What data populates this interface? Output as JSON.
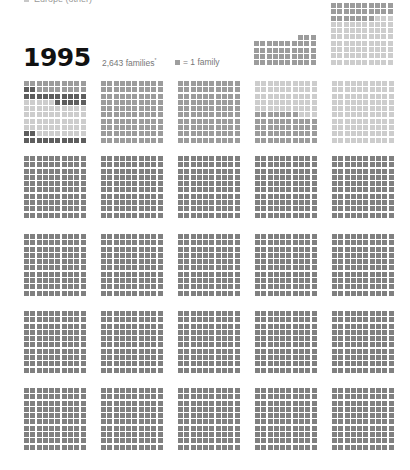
{
  "legend": {
    "label": "Europe (other)",
    "swatch_color": "#c8c8c8"
  },
  "header": {
    "year": "1995",
    "families_label": "2,643 families",
    "families_footnote": "*",
    "unit_label": "= 1 family",
    "unit_swatch_color": "#9e9e9e"
  },
  "colors": {
    "D": "#5e5e5e",
    "M": "#9c9c9c",
    "L": "#cdcdcd",
    "G": "#808080",
    "_": "transparent"
  },
  "chart_data": {
    "type": "waffle",
    "title": "1995",
    "subtitle": "2,643 families*",
    "unit": "1 square = 1 family",
    "legend": [
      "Europe (other)"
    ],
    "grid_size": [
      10,
      10
    ],
    "grids": [
      {
        "id": "top-partial",
        "x": 254,
        "y": 35,
        "rows": [
          "_______MMM",
          "MMMMMMMMMM",
          "MMMMMMMMMM",
          "MMMMMMMMMM",
          "MMMMMMMMMM"
        ],
        "count": 43
      },
      {
        "id": "top-full",
        "x": 331,
        "y": 3,
        "rows": [
          "MMMMMMMMMM",
          "MMMMMMMMMM",
          "MMMMMMMLLL",
          "LLLLLLLLLL",
          "LLLLLLLLLL",
          "LLLLLLLLLL",
          "LLLLLLLLLL",
          "LLLLLLLLLL",
          "LLLLLLLLLL",
          "LLLLLLLLLL"
        ],
        "count": 100
      },
      {
        "id": "r1c1",
        "x": 24,
        "y": 81,
        "rows": [
          "MMMMMMMMMM",
          "DDMMMMMMMM",
          "DDDDDDDDDD",
          "LLLLLDDDDD",
          "LLLLLLLLLL",
          "LLLLLLLLLL",
          "LLLLLLLLLL",
          "LLLLLLLLLL",
          "DDLLLLLLLL",
          "DDDDDDDDDD"
        ],
        "count": 100
      },
      {
        "id": "r1c2",
        "x": 101,
        "y": 81,
        "fill": "M",
        "count": 100
      },
      {
        "id": "r1c3",
        "x": 178,
        "y": 81,
        "fill": "M",
        "count": 100
      },
      {
        "id": "r1c4",
        "x": 255,
        "y": 81,
        "rows": [
          "LLLLLLLLLL",
          "LLLLLLLLLL",
          "LLLLLLLLLL",
          "LLLLLLLLLL",
          "LLLLLLLLLL",
          "MMMMMMMLLL",
          "MMMMMMMMMM",
          "MMMMMMMMMM",
          "MMMMMMMMMM",
          "MMMMMMMMMM"
        ],
        "count": 100
      },
      {
        "id": "r1c5",
        "x": 332,
        "y": 81,
        "fill": "L",
        "count": 100
      },
      {
        "id": "r2c1",
        "x": 24,
        "y": 156,
        "fill": "G",
        "count": 100
      },
      {
        "id": "r2c2",
        "x": 101,
        "y": 156,
        "fill": "G",
        "count": 100
      },
      {
        "id": "r2c3",
        "x": 178,
        "y": 156,
        "fill": "G",
        "count": 100
      },
      {
        "id": "r2c4",
        "x": 255,
        "y": 156,
        "fill": "G",
        "count": 100
      },
      {
        "id": "r2c5",
        "x": 332,
        "y": 156,
        "fill": "G",
        "count": 100
      },
      {
        "id": "r3c1",
        "x": 24,
        "y": 234,
        "fill": "G",
        "count": 100
      },
      {
        "id": "r3c2",
        "x": 101,
        "y": 234,
        "fill": "G",
        "count": 100
      },
      {
        "id": "r3c3",
        "x": 178,
        "y": 234,
        "fill": "G",
        "count": 100
      },
      {
        "id": "r3c4",
        "x": 255,
        "y": 234,
        "fill": "G",
        "count": 100
      },
      {
        "id": "r3c5",
        "x": 332,
        "y": 234,
        "fill": "G",
        "count": 100
      },
      {
        "id": "r4c1",
        "x": 24,
        "y": 311,
        "fill": "G",
        "count": 100
      },
      {
        "id": "r4c2",
        "x": 101,
        "y": 311,
        "fill": "G",
        "count": 100
      },
      {
        "id": "r4c3",
        "x": 178,
        "y": 311,
        "fill": "G",
        "count": 100
      },
      {
        "id": "r4c4",
        "x": 255,
        "y": 311,
        "fill": "G",
        "count": 100
      },
      {
        "id": "r4c5",
        "x": 332,
        "y": 311,
        "fill": "G",
        "count": 100
      },
      {
        "id": "r5c1",
        "x": 24,
        "y": 388,
        "fill": "G",
        "count": 100
      },
      {
        "id": "r5c2",
        "x": 101,
        "y": 388,
        "fill": "G",
        "count": 100
      },
      {
        "id": "r5c3",
        "x": 178,
        "y": 388,
        "fill": "G",
        "count": 100
      },
      {
        "id": "r5c4",
        "x": 255,
        "y": 388,
        "fill": "G",
        "count": 100
      },
      {
        "id": "r5c5",
        "x": 332,
        "y": 388,
        "fill": "G",
        "count": 100
      }
    ]
  }
}
